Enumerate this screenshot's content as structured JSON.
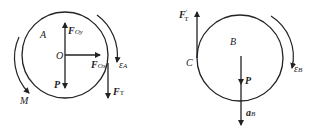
{
  "diagram": {
    "left_body": {
      "name": "A",
      "center_label": "O",
      "forces": {
        "Foy": {
          "main": "F",
          "sub": "Oy"
        },
        "Fox": {
          "main": "F",
          "sub": "Ox"
        },
        "P": "P",
        "FT": {
          "main": "F",
          "sub": "T"
        }
      },
      "moment_label": "M",
      "angular_accel": {
        "main": "ε",
        "sub": "A"
      }
    },
    "right_body": {
      "name": "B",
      "contact_label": "C",
      "forces": {
        "FT_prime": {
          "main": "F",
          "sub": "T",
          "sup": "′"
        },
        "P": "P"
      },
      "acceleration": {
        "main": "a",
        "sub": "B"
      },
      "angular_accel": {
        "main": "ε",
        "sub": "B"
      }
    },
    "colors": {
      "stroke": "#222222",
      "background": "#ffffff"
    }
  }
}
